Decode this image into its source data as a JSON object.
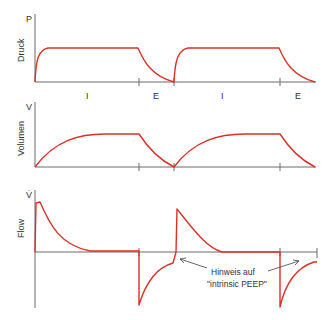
{
  "diagram": {
    "panels": [
      {
        "id": "pressure",
        "axis_symbol": "P",
        "axis_label": "Druck",
        "phase_labels": [
          "I",
          "E",
          "I",
          "E"
        ]
      },
      {
        "id": "volume",
        "axis_symbol": "V",
        "axis_label": "Volumen"
      },
      {
        "id": "flow",
        "axis_symbol": "V̇",
        "axis_label": "Flow"
      }
    ],
    "annotation": {
      "line1": "Hinweis auf",
      "line2": "\"intrinsic PEEP\""
    },
    "colors": {
      "curve": "#d8312a",
      "axis": "#6b6b6b",
      "text": "#333333"
    }
  }
}
